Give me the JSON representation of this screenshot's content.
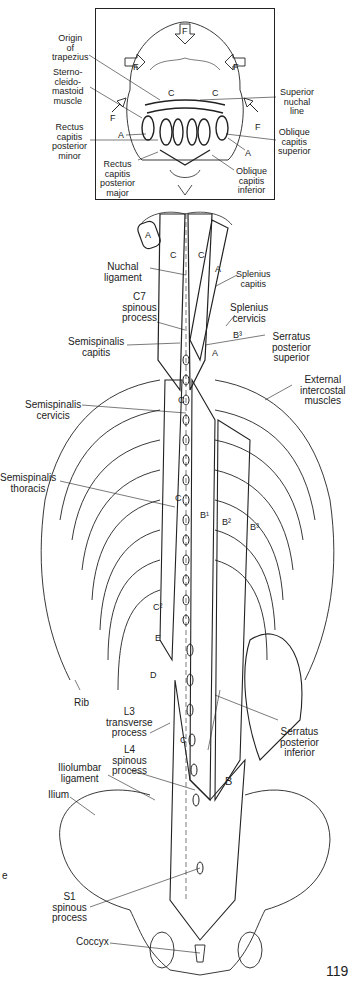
{
  "figure": {
    "page_number": "119",
    "inset": {
      "labels": {
        "origin_of_trapezius": "Origin\nof\ntrapezius",
        "sternocleidomastoid": "Sterno-\ncleido-\nmastoid\nmuscle",
        "rectus_capitis_posterior_minor": "Rectus\ncapitis\nposterior\nminor",
        "rectus_capitis_posterior_major": "Rectus\ncapitis\nposterior\nmajor",
        "superior_nuchal_line": "Superior\nnuchal\nline",
        "oblique_capitis_superior": "Oblique\ncapitis\nsuperior",
        "oblique_capitis_inferior": "Oblique\ncapitis\ninferior"
      },
      "letters": [
        "F",
        "F",
        "F",
        "F",
        "F",
        "C",
        "C",
        "A",
        "A",
        "F",
        "F",
        "F",
        "F"
      ]
    },
    "labels": {
      "nuchal_ligament": "Nuchal\nligament",
      "splenius_capitis": "Splenius\ncapitis",
      "c7_spinous_process": "C7\nspinous\nprocess",
      "splenius_cervicis": "Splenius\ncervicis",
      "semispinalis_capitis": "Semispinalis\ncapitis",
      "serratus_posterior_superior": "Serratus\nposterior\nsuperior",
      "external_intercostal_muscles": "External\nintercostal\nmuscles",
      "semispinalis_cervicis": "Semispinalis\ncervicis",
      "semispinalis_thoracis": "Semispinalis\nthoracis",
      "rib": "Rib",
      "l3_transverse_process": "L3\ntransverse\nprocess",
      "l4_spinous_process": "L4\nspinous\nprocess",
      "serratus_posterior_inferior": "Serratus\nposterior\ninferior",
      "iliolumbar_ligament": "Iliolumbar\nligament",
      "ilium": "Ilium",
      "s1_spinous_process": "S1\nspinous\nprocess",
      "coccyx": "Coccyx",
      "stray_margin_text": "e"
    },
    "muscle_letters": {
      "a_upper": "A",
      "a_splenius": "A",
      "c_left": "C",
      "c_right": "C",
      "b3_upper": "B³",
      "a_small": "A",
      "c_mid": "C",
      "c_thoracic": "C",
      "b1": "B¹",
      "b2": "B²",
      "b3": "B³",
      "c2": "C²",
      "e": "E",
      "d": "D",
      "c_lumbar": "C",
      "b_lumbar": "B"
    },
    "colors": {
      "ink": "#1a1a1a",
      "paper": "#ffffff"
    }
  }
}
